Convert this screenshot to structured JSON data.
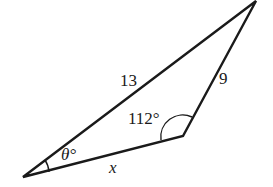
{
  "diagram": {
    "type": "triangle",
    "sides": {
      "long_side": "13",
      "right_side": "9",
      "bottom_side": "x"
    },
    "angles": {
      "obtuse_angle": "112°",
      "left_angle": "θ°"
    },
    "colors": {
      "stroke": "#1a1a1a",
      "background": "#ffffff"
    }
  }
}
